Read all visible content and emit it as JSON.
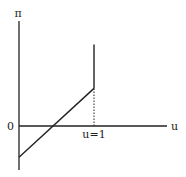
{
  "chart_data": {
    "type": "line",
    "title": "",
    "ylabel": "π",
    "xlabel": "u",
    "origin_label": "0",
    "xtick_labels": [
      "u=1"
    ],
    "xlim": [
      -0.0,
      1.55
    ],
    "ylim": [
      -0.7,
      1.6
    ],
    "series": [
      {
        "name": "profit-linear",
        "style": "solid",
        "points": [
          [
            0,
            -0.5
          ],
          [
            1,
            0.6
          ]
        ]
      },
      {
        "name": "profit-vertical",
        "style": "solid",
        "points": [
          [
            1,
            0.6
          ],
          [
            1,
            1.3
          ]
        ]
      },
      {
        "name": "u1-guide",
        "style": "dotted",
        "points": [
          [
            1,
            0
          ],
          [
            1,
            0.6
          ]
        ]
      }
    ],
    "grid": false,
    "legend": "none",
    "colors": {
      "line": "#222222",
      "axis": "#222222"
    }
  }
}
